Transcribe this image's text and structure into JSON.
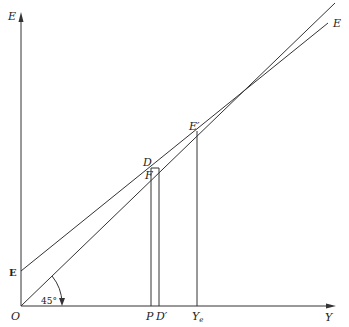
{
  "diagram": {
    "type": "keynesian-cross",
    "axes": {
      "y_label": "E",
      "x_label": "Y",
      "origin_label": "O"
    },
    "lines": [
      {
        "name": "45-degree line",
        "label": "",
        "angle_label": "45°"
      },
      {
        "name": "expenditure line",
        "label": "E",
        "intercept_label": "E"
      }
    ],
    "points": {
      "equilibrium": "E′",
      "d": "D",
      "f": "F"
    },
    "x_ticks": {
      "p": "P",
      "d_prime": "D′",
      "ye": "Y",
      "ye_sub": "e"
    }
  }
}
